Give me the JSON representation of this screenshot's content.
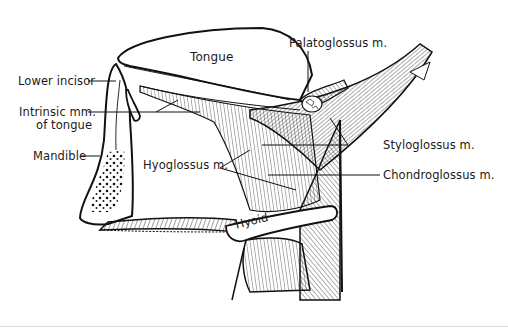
{
  "figure": {
    "stroke_color": "#111111",
    "background_color": "#ffffff"
  },
  "labels": {
    "tongue": "Tongue",
    "palatoglossus": "Palatoglossus m.",
    "lower_incisor": "Lower incisor",
    "intrinsic_line1": "Intrinsic mm.",
    "intrinsic_line2": "of tongue",
    "mandible": "Mandible",
    "hyoglossus": "Hyoglossus m.",
    "styloglossus": "Styloglossus m.",
    "chondroglossus": "Chondroglossus m.",
    "hyoid": "Hyoid"
  }
}
